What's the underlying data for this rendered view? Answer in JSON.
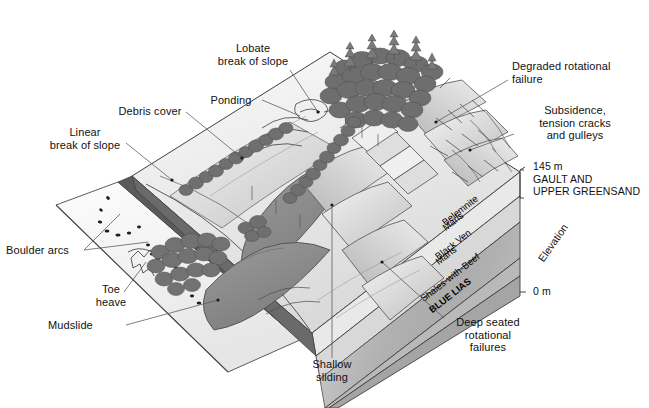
{
  "figure": {
    "kind": "geological-block-diagram",
    "background_color": "#ffffff",
    "ink_color": "#1a1a1a"
  },
  "annotations": {
    "lobate_break": "Lobate\nbreak of slope",
    "ponding": "Ponding",
    "debris_cover": "Debris cover",
    "linear_break": "Linear\nbreak of slope",
    "boulder_arcs": "Boulder arcs",
    "toe_heave": "Toe\nheave",
    "mudslide": "Mudslide",
    "shallow_sliding": "Shallow\nsliding",
    "deep_seated": "Deep seated\nrotational\nfailures",
    "degraded": "Degraded rotational\nfailure",
    "subsidence": "Subsidence,\ntension cracks\nand gulleys"
  },
  "elevation_axis": {
    "label": "Elevation",
    "top_value": "145 m",
    "bottom_value": "0 m"
  },
  "strata": [
    {
      "name": "GAULT AND\nUPPER GREENSAND",
      "line1": "GAULT AND",
      "line2": "UPPER GREENSAND",
      "tone": "#e9e9e9",
      "outside": true
    },
    {
      "name": "Belemnite Marls",
      "line1": "Belemnite",
      "line2": "Marls",
      "tone": "#d8d8d8",
      "outside": false
    },
    {
      "name": "Black Ven Marls",
      "line1": "Black Ven",
      "line2": "Marls",
      "tone": "#c9c9c9",
      "outside": false
    },
    {
      "name": "Shales-with-Beef",
      "line1": "Shales-with-Beef",
      "line2": "",
      "tone": "#bdbdbd",
      "outside": false
    },
    {
      "name": "BLUE LIAS",
      "line1": "BLUE LIAS",
      "line2": "",
      "tone": "#a8a8a8",
      "outside": false
    }
  ],
  "palette": {
    "tree_dark": "#6f6f6f",
    "tree_mid": "#8a8a8a",
    "slope_light": "#f2f2f2",
    "slope_mid": "#d6d6d6",
    "slope_shade": "#b4b4b4",
    "mudslide_grey": "#8e8e8e",
    "beach_light": "#f6f6f6",
    "cliff_edge": "#4a4a4a"
  }
}
